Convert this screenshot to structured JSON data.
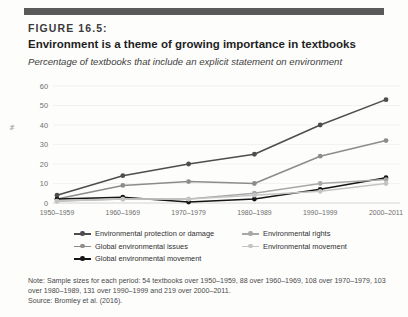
{
  "figure": {
    "number": "FIGURE 16.5:",
    "title": "Environment is a theme of growing importance in textbooks",
    "subtitle": "Percentage of textbooks that include an explicit statement on environment"
  },
  "note": {
    "body": "Note: Sample sizes for each period: 54 textbooks over 1950–1959, 88 over 1960–1969, 108 over 1970–1979, 103 over 1980–1989, 131 over 1990–1999 and 219 over 2000–2011.",
    "source": "Source: Bromley et al. (2016)."
  },
  "chart_data": {
    "type": "line",
    "title": "Environment is a theme of growing importance in textbooks",
    "subtitle": "Percentage of textbooks that include an explicit statement on environment",
    "xlabel": "",
    "ylabel": "%",
    "categories": [
      "1950–1959",
      "1960–1969",
      "1970–1979",
      "1980–1989",
      "1990–1999",
      "2000–2011"
    ],
    "ylim": [
      0,
      60
    ],
    "yticks": [
      0,
      10,
      20,
      30,
      40,
      50,
      60
    ],
    "grid": true,
    "legend_position": "bottom",
    "series": [
      {
        "name": "Environmental protection or damage",
        "color": "#4d4d4d",
        "values": [
          4,
          14,
          20,
          25,
          40,
          53
        ]
      },
      {
        "name": "Global environmental issues",
        "color": "#8c8c8c",
        "values": [
          2,
          9,
          11,
          10,
          24,
          32
        ]
      },
      {
        "name": "Global environmental movement",
        "color": "#151515",
        "values": [
          2,
          3,
          0.5,
          2,
          7,
          13
        ]
      },
      {
        "name": "Environmental rights",
        "color": "#a8a8a8",
        "values": [
          1,
          2,
          2,
          5,
          10,
          12
        ]
      },
      {
        "name": "Environmental movement",
        "color": "#c4c4c4",
        "values": [
          1,
          2,
          2,
          4,
          6,
          10
        ]
      }
    ]
  },
  "legend": {
    "column1": [
      "Environmental protection or damage",
      "Global environmental issues",
      "Global environmental movement"
    ],
    "column2": [
      "Environmental rights",
      "Environmental movement"
    ]
  }
}
